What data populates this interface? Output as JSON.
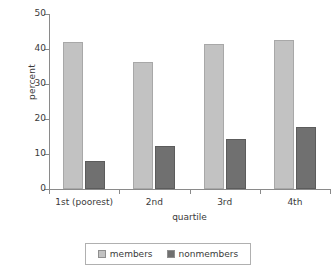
{
  "chart_data": {
    "type": "bar",
    "title": "",
    "xlabel": "quartile",
    "ylabel": "percent",
    "categories": [
      "1st (poorest)",
      "2nd",
      "3rd",
      "4th"
    ],
    "series": [
      {
        "name": "members",
        "color": "#c2c2c2",
        "values": [
          42,
          36.2,
          41.4,
          42.7
        ]
      },
      {
        "name": "nonmembers",
        "color": "#707070",
        "values": [
          8.1,
          12.4,
          14.2,
          17.7
        ]
      }
    ],
    "ylim": [
      0,
      50
    ],
    "ytick_labels": [
      "0",
      "10",
      "20",
      "30",
      "40",
      "50"
    ],
    "ytick_values": [
      0,
      10,
      20,
      30,
      40,
      50
    ],
    "grid": false,
    "legend_position": "bottom",
    "legend_entries": [
      "members",
      "nonmembers"
    ]
  }
}
